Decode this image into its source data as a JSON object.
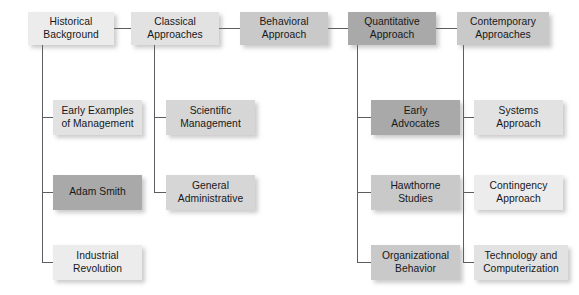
{
  "diagram": {
    "type": "org-tree",
    "background_color": "#ffffff",
    "line_color": "#5a5d61",
    "text_color": "#17181a",
    "columns": [
      {
        "id": "historical-background",
        "header": {
          "label": "Historical\nBackground",
          "tone": "tone-1",
          "x": 28,
          "y": 12,
          "w": 86,
          "h": 33
        },
        "children": [
          {
            "id": "early-examples-of-management",
            "label": "Early Examples\nof Management",
            "tone": "tone-2",
            "x": 53,
            "y": 100,
            "w": 89,
            "h": 35
          },
          {
            "id": "adam-smith",
            "label": "Adam Smith",
            "tone": "tone-6",
            "x": 53,
            "y": 175,
            "w": 89,
            "h": 35
          },
          {
            "id": "industrial-revolution",
            "label": "Industrial\nRevolution",
            "tone": "tone-1",
            "x": 53,
            "y": 245,
            "w": 89,
            "h": 35
          }
        ]
      },
      {
        "id": "classical-approaches",
        "header": {
          "label": "Classical\nApproaches",
          "tone": "tone-2",
          "x": 131,
          "y": 12,
          "w": 88,
          "h": 33
        },
        "children": [
          {
            "id": "scientific-management",
            "label": "Scientific\nManagement",
            "tone": "tone-3",
            "x": 166,
            "y": 100,
            "w": 89,
            "h": 35
          },
          {
            "id": "general-administrative",
            "label": "General\nAdministrative",
            "tone": "tone-3",
            "x": 166,
            "y": 175,
            "w": 89,
            "h": 35
          }
        ]
      },
      {
        "id": "behavioral-approach",
        "header": {
          "label": "Behavioral\nApproach",
          "tone": "tone-4",
          "x": 240,
          "y": 12,
          "w": 88,
          "h": 33
        },
        "children": []
      },
      {
        "id": "quantitative-approach",
        "header": {
          "label": "Quantitative\nApproach",
          "tone": "tone-6",
          "x": 348,
          "y": 12,
          "w": 88,
          "h": 33
        },
        "children": [
          {
            "id": "early-advocates",
            "label": "Early\nAdvocates",
            "tone": "tone-6",
            "x": 371,
            "y": 100,
            "w": 89,
            "h": 35
          },
          {
            "id": "hawthorne-studies",
            "label": "Hawthorne\nStudies",
            "tone": "tone-4",
            "x": 371,
            "y": 175,
            "w": 89,
            "h": 35
          },
          {
            "id": "organizational-behavior",
            "label": "Organizational\nBehavior",
            "tone": "tone-4",
            "x": 371,
            "y": 245,
            "w": 89,
            "h": 35
          }
        ]
      },
      {
        "id": "contemporary-approaches",
        "header": {
          "label": "Contemporary\nApproaches",
          "tone": "tone-4",
          "x": 457,
          "y": 12,
          "w": 92,
          "h": 33
        },
        "children": [
          {
            "id": "systems-approach",
            "label": "Systems\nApproach",
            "tone": "tone-2",
            "x": 474,
            "y": 100,
            "w": 89,
            "h": 35
          },
          {
            "id": "contingency-approach",
            "label": "Contingency\nApproach",
            "tone": "tone-1",
            "x": 474,
            "y": 175,
            "w": 89,
            "h": 35
          },
          {
            "id": "technology-and-computerization",
            "label": "Technology and\nComputerization",
            "tone": "tone-2",
            "x": 474,
            "y": 245,
            "w": 94,
            "h": 35
          }
        ]
      }
    ],
    "horizontal_links": [
      {
        "id": "link-historical-classical",
        "x": 114,
        "y": 28,
        "w": 17
      },
      {
        "id": "link-classical-behavioral",
        "x": 219,
        "y": 28,
        "w": 21
      },
      {
        "id": "link-behavioral-quantitative",
        "x": 328,
        "y": 28,
        "w": 20
      },
      {
        "id": "link-quantitative-contemporary",
        "x": 436,
        "y": 28,
        "w": 21
      }
    ],
    "trunks": [
      {
        "id": "trunk-historical",
        "x": 42,
        "y": 45,
        "h": 218
      },
      {
        "id": "trunk-classical",
        "x": 154,
        "y": 45,
        "h": 148
      },
      {
        "id": "trunk-quantitative",
        "x": 357,
        "y": 45,
        "h": 218
      },
      {
        "id": "trunk-contemporary",
        "x": 463,
        "y": 45,
        "h": 218
      }
    ],
    "branches": [
      {
        "id": "branch-early-examples",
        "x": 42,
        "y": 117,
        "w": 11
      },
      {
        "id": "branch-adam-smith",
        "x": 42,
        "y": 192,
        "w": 11
      },
      {
        "id": "branch-industrial",
        "x": 42,
        "y": 262,
        "w": 11
      },
      {
        "id": "branch-scientific",
        "x": 154,
        "y": 117,
        "w": 12
      },
      {
        "id": "branch-general-admin",
        "x": 154,
        "y": 192,
        "w": 12
      },
      {
        "id": "branch-early-advocates",
        "x": 357,
        "y": 117,
        "w": 14
      },
      {
        "id": "branch-hawthorne",
        "x": 357,
        "y": 192,
        "w": 14
      },
      {
        "id": "branch-organizational",
        "x": 357,
        "y": 262,
        "w": 14
      },
      {
        "id": "branch-systems",
        "x": 463,
        "y": 117,
        "w": 11
      },
      {
        "id": "branch-contingency",
        "x": 463,
        "y": 192,
        "w": 11
      },
      {
        "id": "branch-technology",
        "x": 463,
        "y": 262,
        "w": 11
      }
    ]
  }
}
